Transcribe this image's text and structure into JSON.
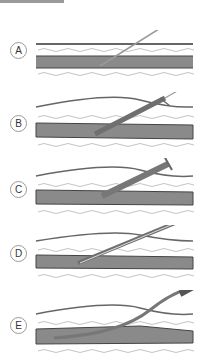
{
  "figure": {
    "steps": [
      {
        "label": "A",
        "description": "Needle inserted into vessel"
      },
      {
        "label": "B",
        "description": "Guidewire with dilator/sheath advanced"
      },
      {
        "label": "C",
        "description": "Sheath inserted into vessel"
      },
      {
        "label": "D",
        "description": "Catheter passed through sheath"
      },
      {
        "label": "E",
        "description": "Catheter in vessel, sheath withdrawn"
      }
    ]
  },
  "colors": {
    "vessel": "#8a8a8a",
    "vessel_dark": "#5a5a5a",
    "tissue_line": "#b5b5b5",
    "instrument": "#7a7a7a",
    "label_border": "#9a9a9a"
  }
}
